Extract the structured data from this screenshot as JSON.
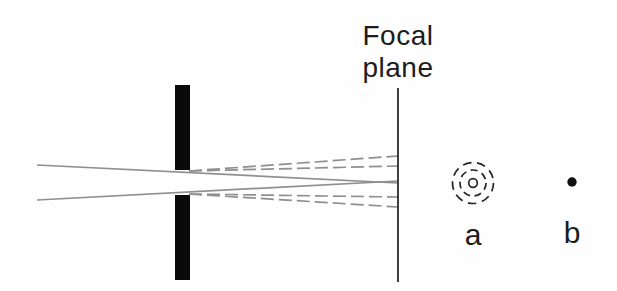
{
  "figure": {
    "background": "#fefefe",
    "ink_color": "#1c1c1c",
    "ray_color": "#8f8f8f",
    "labels": {
      "focal_plane_line1": "Focal",
      "focal_plane_line2": "plane",
      "pattern_a": "a",
      "pattern_b": "b"
    },
    "aperture": {
      "x": 175,
      "width": 15,
      "top_segment": {
        "y1": 85,
        "y2": 170
      },
      "bottom_segment": {
        "y1": 195,
        "y2": 280
      },
      "fill": "#0a0a0a"
    },
    "focal_plane_line": {
      "x": 398,
      "y1": 88,
      "y2": 282,
      "stroke": "#2b2b2b",
      "stroke_width": 1.8
    },
    "solid_rays": {
      "stroke_width": 1.7,
      "items": [
        {
          "name": "incoming-ray-upper",
          "x1": 37,
          "y1": 165,
          "x2": 398,
          "y2": 183
        },
        {
          "name": "incoming-ray-lower",
          "x1": 37,
          "y1": 200,
          "x2": 398,
          "y2": 181
        }
      ]
    },
    "dashed_rays": {
      "stroke_width": 1.7,
      "dasharray": "13,5",
      "items": [
        {
          "name": "diffraction-ray-upper-outer",
          "x1": 189,
          "y1": 171,
          "x2": 398,
          "y2": 156
        },
        {
          "name": "diffraction-ray-upper-inner",
          "x1": 189,
          "y1": 171,
          "x2": 398,
          "y2": 166
        },
        {
          "name": "diffraction-ray-lower-inner",
          "x1": 189,
          "y1": 194,
          "x2": 398,
          "y2": 197
        },
        {
          "name": "diffraction-ray-lower-outer",
          "x1": 189,
          "y1": 194,
          "x2": 398,
          "y2": 207
        }
      ]
    },
    "airy_pattern": {
      "cx": 473,
      "cy": 183,
      "stroke": "#262626",
      "stroke_width": 1.7,
      "rings": [
        {
          "name": "airy-ring-outer",
          "r": 20.5,
          "dasharray": "8.6,5.7"
        },
        {
          "name": "airy-ring-middle",
          "r": 13,
          "dasharray": "7,4.7"
        },
        {
          "name": "airy-ring-inner",
          "r": 4.3,
          "dasharray": ""
        }
      ]
    },
    "point_image": {
      "cx": 572,
      "cy": 182,
      "r": 4.7,
      "fill": "#111111"
    }
  }
}
